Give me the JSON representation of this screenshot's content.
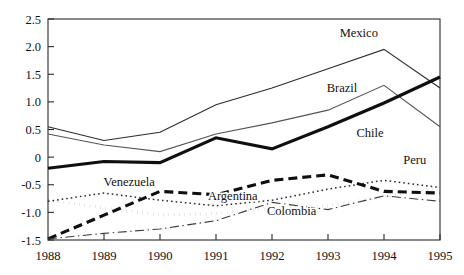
{
  "chart_data": {
    "type": "line",
    "title": "",
    "subtitle": "",
    "xlabel": "",
    "ylabel": "",
    "x": [
      1988,
      1989,
      1990,
      1991,
      1992,
      1993,
      1994,
      1995
    ],
    "xtick_labels": [
      "1988",
      "1989",
      "1990",
      "1991",
      "1992",
      "1993",
      "1994",
      "1995"
    ],
    "ytick_labels": [
      "2.5",
      "2.0",
      "1.5",
      "1.0",
      "0.5",
      "0",
      "-0.5",
      "-1.0",
      "-1.5"
    ],
    "ytick_values": [
      2.5,
      2.0,
      1.5,
      1.0,
      0.5,
      0,
      -0.5,
      -1.0,
      -1.5
    ],
    "xlim": [
      1988,
      1995
    ],
    "ylim": [
      -1.5,
      2.5
    ],
    "grid": false,
    "legend_position": "inline-annotations",
    "series": [
      {
        "name": "Mexico",
        "values": [
          0.55,
          0.3,
          0.45,
          0.95,
          1.25,
          1.6,
          1.95,
          1.25
        ],
        "style": "solid-thin",
        "color": "#2b2b2b",
        "label_x": 1993.55,
        "label_y": 2.17
      },
      {
        "name": "Brazil",
        "values": [
          0.42,
          0.22,
          0.1,
          0.42,
          0.62,
          0.85,
          1.3,
          0.55
        ],
        "style": "solid-thin",
        "color": "#555555",
        "label_x": 1993.25,
        "label_y": 1.17
      },
      {
        "name": "Chile",
        "values": [
          -0.2,
          -0.08,
          -0.1,
          0.35,
          0.15,
          0.55,
          0.98,
          1.45
        ],
        "style": "solid-thick",
        "color": "#0f0f0f",
        "label_x": 1993.75,
        "label_y": 0.37
      },
      {
        "name": "Peru",
        "values": [
          -0.8,
          -0.65,
          -0.78,
          -0.88,
          -0.78,
          -0.58,
          -0.42,
          -0.55
        ],
        "style": "dotted-fine",
        "color": "#2b2b2b",
        "label_x": 1994.55,
        "label_y": -0.12
      },
      {
        "name": "Venezuela",
        "values": [
          -1.48,
          -1.05,
          -0.62,
          -0.68,
          -0.42,
          -0.32,
          -0.62,
          -0.65
        ],
        "style": "dashed-thick",
        "color": "#0f0f0f",
        "label_x": 1989.45,
        "label_y": -0.52
      },
      {
        "name": "Argentina",
        "values": [
          -1.48,
          -1.38,
          -1.3,
          -1.15,
          -0.82,
          -0.95,
          -0.7,
          -0.8
        ],
        "style": "dash-dot",
        "color": "#3a3a3a",
        "label_x": 1991.3,
        "label_y": -0.78
      },
      {
        "name": "Colombia",
        "values": [
          -0.78,
          -0.92,
          -1.05,
          -1.02,
          -0.92,
          -0.88,
          -0.72,
          -0.55
        ],
        "style": "dotted-thick",
        "color": "#111111",
        "label_x": 1992.35,
        "label_y": -1.05
      }
    ]
  },
  "plot_geometry": {
    "left": 48,
    "right": 440,
    "top": 19,
    "bottom": 240
  }
}
